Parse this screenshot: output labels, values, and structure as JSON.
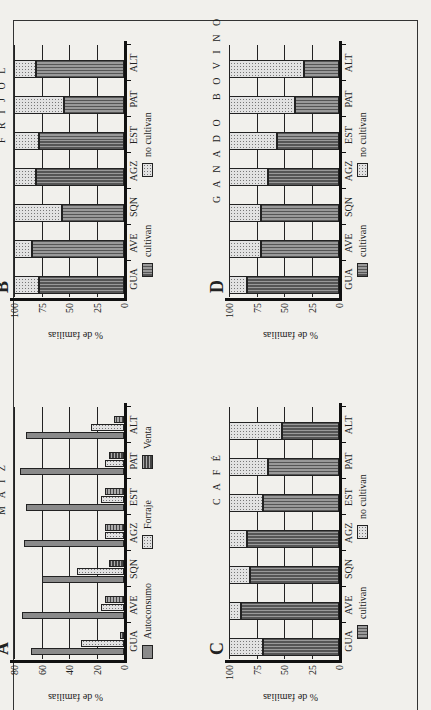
{
  "page": {
    "background": "#f1f0ec"
  },
  "categories": [
    "GUA",
    "AVE",
    "SQN",
    "AGZ",
    "EST",
    "PAT",
    "ALT"
  ],
  "panels": {
    "A": {
      "letter": "A",
      "title": "M A I Z",
      "ylabel": "% de familias",
      "yticks": [
        "0",
        "20",
        "40",
        "60",
        "80"
      ],
      "legend": [
        "Autoconsumo",
        "Forraje",
        "Venta"
      ]
    },
    "B": {
      "letter": "B",
      "title": "F R I J O L",
      "ylabel": "% de familias",
      "yticks": [
        "0",
        "25",
        "50",
        "75",
        "100"
      ],
      "legend": [
        "cultivan",
        "no cultivan"
      ]
    },
    "C": {
      "letter": "C",
      "title": "C A F É",
      "ylabel": "% de familias",
      "yticks": [
        "0",
        "25",
        "50",
        "75",
        "100"
      ],
      "legend": [
        "cultivan",
        "no cultivan"
      ]
    },
    "D": {
      "letter": "D",
      "title": "G A N A D O   B O V I N O",
      "ylabel": "% de familias",
      "yticks": [
        "0",
        "25",
        "50",
        "75",
        "100"
      ],
      "legend": [
        "cultivan",
        "no cultivan"
      ]
    }
  },
  "chart_data": [
    {
      "id": "A",
      "type": "bar",
      "title": "MAIZ",
      "xlabel": "",
      "ylabel": "% de familias",
      "ylim": [
        0,
        80
      ],
      "categories": [
        "GUA",
        "AVE",
        "SQN",
        "AGZ",
        "EST",
        "PAT",
        "ALT"
      ],
      "series": [
        {
          "name": "Autoconsumo",
          "values": [
            68,
            74,
            60,
            73,
            71,
            76,
            71
          ]
        },
        {
          "name": "Forraje",
          "values": [
            31,
            17,
            34,
            14,
            17,
            14,
            24
          ]
        },
        {
          "name": "Venta",
          "values": [
            3,
            14,
            11,
            14,
            14,
            11,
            7
          ]
        }
      ],
      "grid": true,
      "legend_position": "bottom"
    },
    {
      "id": "B",
      "type": "bar",
      "stacked": true,
      "title": "FRIJOL",
      "xlabel": "",
      "ylabel": "% de familias",
      "ylim": [
        0,
        100
      ],
      "categories": [
        "GUA",
        "AVE",
        "SQN",
        "AGZ",
        "EST",
        "PAT",
        "ALT"
      ],
      "series": [
        {
          "name": "cultivan",
          "values": [
            77,
            84,
            56,
            80,
            77,
            55,
            80
          ]
        },
        {
          "name": "no cultivan",
          "values": [
            23,
            16,
            44,
            20,
            23,
            45,
            20
          ]
        }
      ],
      "grid": true,
      "legend_position": "bottom"
    },
    {
      "id": "C",
      "type": "bar",
      "stacked": true,
      "title": "CAFÉ",
      "xlabel": "",
      "ylabel": "% de familias",
      "ylim": [
        0,
        100
      ],
      "categories": [
        "GUA",
        "AVE",
        "SQN",
        "AGZ",
        "EST",
        "PAT",
        "ALT"
      ],
      "series": [
        {
          "name": "cultivan",
          "values": [
            69,
            89,
            81,
            84,
            69,
            65,
            52
          ]
        },
        {
          "name": "no cultivan",
          "values": [
            31,
            11,
            19,
            16,
            31,
            35,
            48
          ]
        }
      ],
      "grid": true,
      "legend_position": "bottom"
    },
    {
      "id": "D",
      "type": "bar",
      "stacked": true,
      "title": "GANADO BOVINO",
      "xlabel": "",
      "ylabel": "% de familias",
      "ylim": [
        0,
        100
      ],
      "categories": [
        "GUA",
        "AVE",
        "SQN",
        "AGZ",
        "EST",
        "PAT",
        "ALT"
      ],
      "series": [
        {
          "name": "cultivan",
          "values": [
            84,
            71,
            71,
            65,
            56,
            40,
            32
          ]
        },
        {
          "name": "no cultivan",
          "values": [
            16,
            29,
            29,
            35,
            44,
            60,
            68
          ]
        }
      ],
      "grid": true,
      "legend_position": "bottom"
    }
  ]
}
